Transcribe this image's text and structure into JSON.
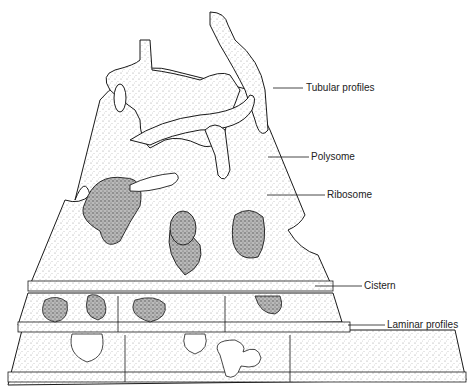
{
  "diagram": {
    "labels": [
      {
        "id": "tubular-profiles",
        "text": "Tubular profiles",
        "x": 306,
        "y": 83
      },
      {
        "id": "polysome",
        "text": "Polysome",
        "x": 311,
        "y": 152
      },
      {
        "id": "ribosome",
        "text": "Ribosome",
        "x": 327,
        "y": 190
      },
      {
        "id": "cistern",
        "text": "Cistern",
        "x": 364,
        "y": 280
      },
      {
        "id": "laminar-profiles",
        "text": "Laminar profiles",
        "x": 387,
        "y": 320
      }
    ],
    "colors": {
      "outline": "#1a1a1a",
      "stipple": "#555555",
      "background": "#ffffff"
    }
  }
}
